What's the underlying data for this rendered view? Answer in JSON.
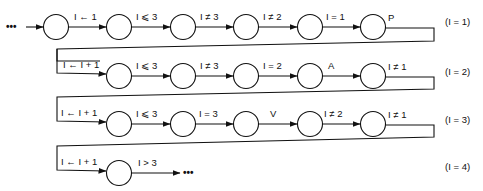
{
  "diagram": {
    "type": "state-transition automaton",
    "start_ellipsis": "•••",
    "end_ellipsis": "•••",
    "rows": [
      {
        "row_label": "(I = 1)",
        "edges": [
          "I ← 1",
          "I ⩽ 3",
          "I ≠ 3",
          "I ≠ 2",
          "I = 1",
          "P"
        ]
      },
      {
        "row_label": "(I = 2)",
        "edges": [
          "I ← I + 1",
          "I ⩽ 3",
          "I ≠ 3",
          "I = 2",
          "A",
          "I ≠ 1"
        ]
      },
      {
        "row_label": "(I = 3)",
        "edges": [
          "I ← I + 1",
          "I ⩽ 3",
          "I = 3",
          "V",
          "I ≠ 2",
          "I ≠ 1"
        ]
      },
      {
        "row_label": "(I = 4)",
        "edges": [
          "I ← I + 1",
          "I > 3"
        ]
      }
    ],
    "colors": {
      "stroke": "#111111",
      "background": "#ffffff"
    }
  }
}
